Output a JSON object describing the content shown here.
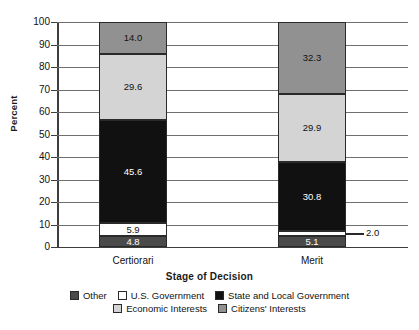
{
  "chart_data": {
    "type": "bar",
    "subtype": "stacked-bar-100",
    "title": "",
    "xlabel": "Stage of Decision",
    "ylabel": "Percent",
    "ylim": [
      0,
      100
    ],
    "yticks": [
      0,
      10,
      20,
      30,
      40,
      50,
      60,
      70,
      80,
      90,
      100
    ],
    "ytick_labels": [
      "0",
      "10",
      "20",
      "30",
      "40",
      "50",
      "60",
      "70",
      "80",
      "90",
      "100"
    ],
    "grid": true,
    "grid_axis": "y",
    "legend_position": "bottom",
    "categories": [
      "Certiorari",
      "Merit"
    ],
    "stack_order_bottom_to_top": [
      "Other",
      "U.S. Government",
      "State and Local Government",
      "Economic Interests",
      "Citizens' Interests"
    ],
    "series": [
      {
        "name": "Other",
        "color": "#4a4a4a",
        "text_color": "#ffffff",
        "values": [
          4.8,
          5.1
        ],
        "labels": [
          "4.8",
          "5.1"
        ],
        "label_placement": [
          "inside",
          "inside"
        ]
      },
      {
        "name": "U.S. Government",
        "color": "#ffffff",
        "text_color": "#111111",
        "values": [
          5.9,
          2.0
        ],
        "labels": [
          "5.9",
          "2.0"
        ],
        "label_placement": [
          "inside",
          "outside-right"
        ]
      },
      {
        "name": "State and Local Government",
        "color": "#111111",
        "text_color": "#ffffff",
        "values": [
          45.6,
          30.8
        ],
        "labels": [
          "45.6",
          "30.8"
        ],
        "label_placement": [
          "inside",
          "inside"
        ]
      },
      {
        "name": "Economic Interests",
        "color": "#d4d4d4",
        "text_color": "#111111",
        "values": [
          29.6,
          29.9
        ],
        "labels": [
          "29.6",
          "29.9"
        ],
        "label_placement": [
          "inside",
          "inside"
        ]
      },
      {
        "name": "Citizens' Interests",
        "color": "#919191",
        "text_color": "#111111",
        "values": [
          14.0,
          32.3
        ],
        "labels": [
          "14.0",
          "32.3"
        ],
        "label_placement": [
          "inside",
          "inside"
        ]
      }
    ]
  },
  "legend": {
    "rows": [
      [
        {
          "label": "Other",
          "color": "#4a4a4a"
        },
        {
          "label": "U.S. Government",
          "color": "#ffffff"
        },
        {
          "label": "State and Local Government",
          "color": "#111111"
        }
      ],
      [
        {
          "label": "Economic Interests",
          "color": "#d4d4d4"
        },
        {
          "label": "Citizens' Interests",
          "color": "#919191"
        }
      ]
    ]
  }
}
